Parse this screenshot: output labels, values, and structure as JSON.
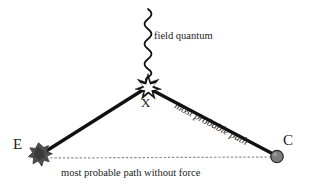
{
  "figure": {
    "background_color": "#ffffff",
    "width": 310,
    "height": 187,
    "line_color": "#111111",
    "dotted_line_color": "#8a8a8a",
    "vertex_marker_color": "#111111",
    "emitter_blob_color": "#4a4a4a",
    "receiver_dot_color": "#7a7a7a"
  },
  "labels": {
    "field_quantum": "field quantum",
    "vertex_x": "X",
    "point_e": "E",
    "point_c": "C",
    "most_probable_path": "most probable path",
    "path_without_force": "most probable path without force"
  },
  "elements": {
    "wavy_line_name": "field-quantum-wavy-line",
    "star_name": "vertex-star-icon",
    "emitter_name": "emitter-blob-icon",
    "receiver_name": "receiver-dot-icon"
  },
  "geometry": {
    "vertex_x": [
      148,
      87
    ],
    "point_e": [
      42,
      154
    ],
    "point_c": [
      277,
      156
    ],
    "wave_top": [
      148,
      9
    ],
    "wave_bottom": [
      148,
      80
    ],
    "wave_amplitude": 4.2,
    "wave_periods": 10
  }
}
